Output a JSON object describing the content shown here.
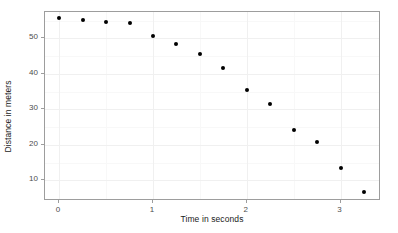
{
  "chart_data": {
    "type": "scatter",
    "title": "",
    "xlabel": "Time in seconds",
    "ylabel": "Distance in meters",
    "xlim": [
      -0.15,
      3.43
    ],
    "ylim": [
      4.2,
      57.4
    ],
    "grid": true,
    "legend": null,
    "x_ticks": [
      {
        "value": 0,
        "label": "0"
      },
      {
        "value": 1,
        "label": "1"
      },
      {
        "value": 2,
        "label": "2"
      },
      {
        "value": 3,
        "label": "3"
      }
    ],
    "y_ticks": [
      {
        "value": 10,
        "label": "10"
      },
      {
        "value": 20,
        "label": "20"
      },
      {
        "value": 30,
        "label": "30"
      },
      {
        "value": 40,
        "label": "40"
      },
      {
        "value": 50,
        "label": "50"
      }
    ],
    "x_minor_ticks": [
      0.5,
      1.5,
      2.5
    ],
    "y_minor_ticks": [
      15,
      25,
      35,
      45,
      55
    ],
    "marker": {
      "shape": "circle",
      "color": "#000000",
      "size_px": 4
    },
    "x": [
      0,
      0.25,
      0.5,
      0.75,
      1.0,
      1.25,
      1.5,
      1.75,
      2.0,
      2.25,
      2.5,
      2.75,
      3.0,
      3.25
    ],
    "y": [
      55.7,
      55.1,
      54.7,
      54.2,
      50.6,
      48.5,
      45.6,
      41.7,
      35.5,
      31.4,
      24.3,
      20.9,
      13.4,
      6.7
    ],
    "series": [
      {
        "name": "distance",
        "points": [
          {
            "x": 0,
            "y": 55.7
          },
          {
            "x": 0.25,
            "y": 55.1
          },
          {
            "x": 0.5,
            "y": 54.7
          },
          {
            "x": 0.75,
            "y": 54.2
          },
          {
            "x": 1.0,
            "y": 50.6
          },
          {
            "x": 1.25,
            "y": 48.5
          },
          {
            "x": 1.5,
            "y": 45.6
          },
          {
            "x": 1.75,
            "y": 41.7
          },
          {
            "x": 2.0,
            "y": 35.5
          },
          {
            "x": 2.25,
            "y": 31.4
          },
          {
            "x": 2.5,
            "y": 24.3
          },
          {
            "x": 2.75,
            "y": 20.9
          },
          {
            "x": 3.0,
            "y": 13.4
          },
          {
            "x": 3.25,
            "y": 6.7
          }
        ]
      }
    ],
    "colors": {
      "point": "#000000",
      "panel_border": "#9d9d9d",
      "grid_major": "#f0f0f0",
      "grid_minor": "#f8f8f8",
      "background": "#ffffff",
      "tick_label": "#4d4d4d",
      "axis_title": "#1a1a1a"
    }
  }
}
